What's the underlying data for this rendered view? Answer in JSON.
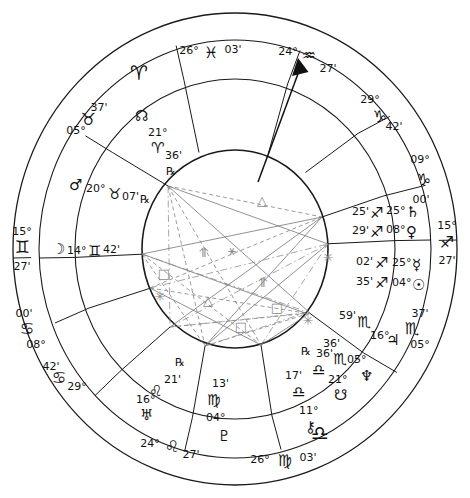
{
  "chart": {
    "type": "astrological-wheel",
    "house_system_rings": 3,
    "colors": {
      "ink": "#111111",
      "aspect_grey": "#8a8a8a",
      "background": "#ffffff"
    }
  },
  "sign_glyphs": {
    "aries": "♈",
    "taurus": "♉",
    "gemini": "♊",
    "cancer": "♋",
    "leo": "♌",
    "virgo": "♍",
    "libra": "♎",
    "scorpio": "♏",
    "sagittarius": "♐",
    "capricorn": "♑",
    "aquarius": "♒",
    "pisces": "♓"
  },
  "planet_glyphs": {
    "sun": "☉",
    "moon": "☽",
    "mercury": "☿",
    "venus": "♀",
    "mars": "♂",
    "jupiter": "♃",
    "saturn": "♄",
    "uranus": "♅",
    "neptune": "♆",
    "pluto": "♇",
    "north_node": "☊",
    "south_node": "☋",
    "chiron": "⚷",
    "retrograde": "℞"
  },
  "outer_ring_markers": [
    {
      "name": "aries-cardinal-marker",
      "glyph": "♈",
      "label": ""
    }
  ],
  "angles": [
    {
      "name": "ascendant",
      "deg": "15°",
      "sign": "♊",
      "min": "27'",
      "sign_name": "gemini"
    },
    {
      "name": "descendant",
      "deg": "15°",
      "sign": "♐",
      "min": "27'",
      "sign_name": "sagittarius"
    },
    {
      "name": "midheaven",
      "deg": "24°",
      "sign": "♒",
      "min": "27'",
      "sign_name": "aquarius"
    },
    {
      "name": "imum-coeli",
      "deg": "24°",
      "sign": "♌",
      "min": "27'",
      "sign_name": "leo"
    }
  ],
  "house_cusps": [
    {
      "house": 1,
      "deg": "15°",
      "sign": "♊",
      "min": "27'"
    },
    {
      "house": 2,
      "deg": "08°",
      "sign": "♋",
      "min": "00'"
    },
    {
      "house": 3,
      "deg": "29°",
      "sign": "♋",
      "min": "42'"
    },
    {
      "house": 4,
      "deg": "24°",
      "sign": "♌",
      "min": "27'"
    },
    {
      "house": 5,
      "deg": "26°",
      "sign": "♍",
      "min": "03'"
    },
    {
      "house": 6,
      "deg": "05°",
      "sign": "♏",
      "min": "37'"
    },
    {
      "house": 7,
      "deg": "15°",
      "sign": "♐",
      "min": "27'"
    },
    {
      "house": 8,
      "deg": "09°",
      "sign": "♑",
      "min": "00'"
    },
    {
      "house": 9,
      "deg": "29°",
      "sign": "♑",
      "min": "42'"
    },
    {
      "house": 10,
      "deg": "24°",
      "sign": "♒",
      "min": "27'"
    },
    {
      "house": 11,
      "deg": "26°",
      "sign": "♓",
      "min": "03'"
    },
    {
      "house": 12,
      "deg": "05°",
      "sign": "♉",
      "min": "37'"
    }
  ],
  "planets": [
    {
      "name": "north-node",
      "glyph": "☊",
      "deg": "21°",
      "sign": "♈",
      "min": "36'",
      "retrograde": "℞"
    },
    {
      "name": "mars",
      "glyph": "♂",
      "deg": "20°",
      "sign": "♉",
      "min": "07'",
      "retrograde": "℞"
    },
    {
      "name": "moon",
      "glyph": "☽",
      "deg": "14°",
      "sign": "♊",
      "min": "42'",
      "retrograde": ""
    },
    {
      "name": "uranus",
      "glyph": "♅",
      "deg": "16°",
      "sign": "♌",
      "min": "21'",
      "retrograde": "℞"
    },
    {
      "name": "pluto",
      "glyph": "♇",
      "deg": "04°",
      "sign": "♍",
      "min": "13'",
      "retrograde": ""
    },
    {
      "name": "south-node",
      "glyph": "☋",
      "deg": "21°",
      "sign": "♎",
      "min": "36'",
      "retrograde": "℞"
    },
    {
      "name": "chiron",
      "glyph": "⚷",
      "deg": "11°",
      "sign": "♎",
      "min": "17'",
      "retrograde": ""
    },
    {
      "name": "neptune",
      "glyph": "♆",
      "deg": "05°",
      "sign": "♏",
      "min": "36'",
      "retrograde": "℞"
    },
    {
      "name": "jupiter",
      "glyph": "♃",
      "deg": "16°",
      "sign": "♏",
      "min": "59'",
      "retrograde": ""
    },
    {
      "name": "sun",
      "glyph": "☉",
      "deg": "04°",
      "sign": "♐",
      "min": "35'",
      "retrograde": ""
    },
    {
      "name": "venus",
      "glyph": "♀",
      "deg": "08°",
      "sign": "♐",
      "min": "29'",
      "retrograde": ""
    },
    {
      "name": "mercury",
      "glyph": "☿",
      "deg": "25°",
      "sign": "♐",
      "min": "02'",
      "retrograde": ""
    },
    {
      "name": "saturn",
      "glyph": "♄",
      "deg": "25°",
      "sign": "♐",
      "min": "25'",
      "retrograde": ""
    }
  ],
  "aspect_markers": [
    {
      "name": "trine-marker",
      "symbol": "△",
      "x": 262,
      "y": 205
    },
    {
      "name": "sextile-marker",
      "symbol": "✳",
      "x": 160,
      "y": 301
    },
    {
      "name": "square-marker",
      "symbol": "□",
      "x": 164,
      "y": 278
    },
    {
      "name": "quincunx-marker",
      "symbol": "⥣",
      "x": 203,
      "y": 257
    },
    {
      "name": "conjunction-marker",
      "symbol": "⚹",
      "x": 232,
      "y": 255
    },
    {
      "name": "trine-marker-2",
      "symbol": "△",
      "x": 208,
      "y": 305
    },
    {
      "name": "square-marker-2",
      "symbol": "□",
      "x": 241,
      "y": 331
    },
    {
      "name": "quincunx-marker-2",
      "symbol": "⥣",
      "x": 262,
      "y": 287
    },
    {
      "name": "square-marker-3",
      "symbol": "□",
      "x": 277,
      "y": 312
    },
    {
      "name": "sextile-marker-2",
      "symbol": "✳",
      "x": 328,
      "y": 262
    },
    {
      "name": "sextile-marker-3",
      "symbol": "✳",
      "x": 308,
      "y": 325
    }
  ]
}
